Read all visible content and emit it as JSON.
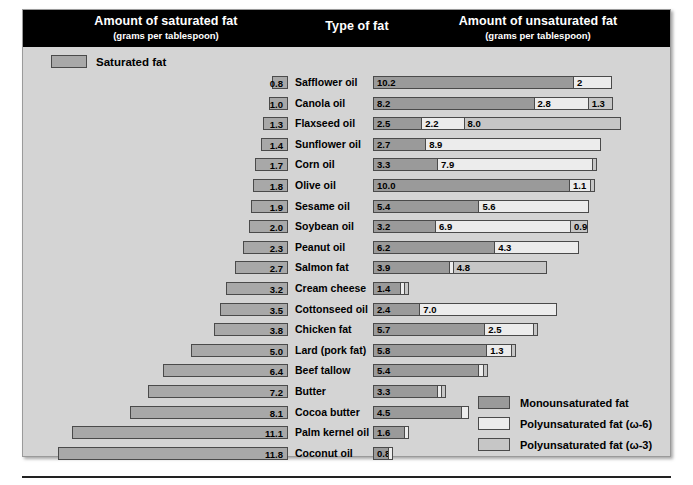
{
  "header": {
    "left_title": "Amount of saturated fat",
    "left_subtitle": "(grams per tablespoon)",
    "middle_title": "Type of fat",
    "right_title": "Amount of unsaturated fat",
    "right_subtitle": "(grams per tablespoon)"
  },
  "saturated_key": {
    "label": "Saturated fat",
    "swatch": "saturated-swatch"
  },
  "legend": {
    "items": [
      {
        "label": "Monounsaturated fat",
        "key": "mono",
        "color": "#9a9a9a"
      },
      {
        "label": "Polyunsaturated fat (ω-6)",
        "key": "o6",
        "color": "#ececec"
      },
      {
        "label": "Polyunsaturated fat (ω-3)",
        "key": "o3",
        "color": "#c6c6c6"
      }
    ]
  },
  "colors": {
    "saturated": "#a8a8a8",
    "mono": "#9a9a9a",
    "omega6": "#ececec",
    "omega3": "#c6c6c6",
    "panel_bg": "#d4d4d4",
    "header_bg": "#000000",
    "outline": "#4a4a4a"
  },
  "chart_data": {
    "type": "bar",
    "subtitle": "grams per tablespoon",
    "xlabel": "grams per tablespoon",
    "ylabel": "Type of fat",
    "orientation": "horizontal",
    "layout": "diverging stacked bars; saturated fat extends left, unsaturated fat extends right",
    "grid": false,
    "legend_position": "bottom-right",
    "series": [
      {
        "name": "Saturated fat",
        "color": "#a8a8a8"
      },
      {
        "name": "Monounsaturated fat",
        "color": "#9a9a9a"
      },
      {
        "name": "Polyunsaturated fat (ω-6)",
        "color": "#ececec"
      },
      {
        "name": "Polyunsaturated fat (ω-3)",
        "color": "#c6c6c6"
      }
    ],
    "categories": [
      "Safflower oil",
      "Canola oil",
      "Flaxseed oil",
      "Sunflower oil",
      "Corn oil",
      "Olive oil",
      "Sesame oil",
      "Soybean oil",
      "Peanut oil",
      "Salmon fat",
      "Cream cheese",
      "Cottonseed oil",
      "Chicken fat",
      "Lard (pork fat)",
      "Beef tallow",
      "Butter",
      "Cocoa butter",
      "Palm kernel oil",
      "Coconut oil"
    ],
    "rows": [
      {
        "name": "Safflower oil",
        "saturated": 0.8,
        "saturated_label": "0.8",
        "mono": 10.2,
        "mono_label": "10.2",
        "omega6": 2.0,
        "omega6_label": "2",
        "omega3": 0.0,
        "omega3_label": ""
      },
      {
        "name": "Canola oil",
        "saturated": 1.0,
        "saturated_label": "1.0",
        "mono": 8.2,
        "mono_label": "8.2",
        "omega6": 2.8,
        "omega6_label": "2.8",
        "omega3": 1.3,
        "omega3_label": "1.3"
      },
      {
        "name": "Flaxseed oil",
        "saturated": 1.3,
        "saturated_label": "1.3",
        "mono": 2.5,
        "mono_label": "2.5",
        "omega6": 2.2,
        "omega6_label": "2.2",
        "omega3": 8.0,
        "omega3_label": "8.0"
      },
      {
        "name": "Sunflower oil",
        "saturated": 1.4,
        "saturated_label": "1.4",
        "mono": 2.7,
        "mono_label": "2.7",
        "omega6": 8.9,
        "omega6_label": "8.9",
        "omega3": 0.0,
        "omega3_label": ""
      },
      {
        "name": "Corn oil",
        "saturated": 1.7,
        "saturated_label": "1.7",
        "mono": 3.3,
        "mono_label": "3.3",
        "omega6": 7.9,
        "omega6_label": "7.9",
        "omega3": 0.15,
        "omega3_label": ""
      },
      {
        "name": "Olive oil",
        "saturated": 1.8,
        "saturated_label": "1.8",
        "mono": 10.0,
        "mono_label": "10.0",
        "omega6": 1.1,
        "omega6_label": "1.1",
        "omega3": 0.1,
        "omega3_label": ""
      },
      {
        "name": "Sesame oil",
        "saturated": 1.9,
        "saturated_label": "1.9",
        "mono": 5.4,
        "mono_label": "5.4",
        "omega6": 5.6,
        "omega6_label": "5.6",
        "omega3": 0.0,
        "omega3_label": ""
      },
      {
        "name": "Soybean oil",
        "saturated": 2.0,
        "saturated_label": "2.0",
        "mono": 3.2,
        "mono_label": "3.2",
        "omega6": 6.9,
        "omega6_label": "6.9",
        "omega3": 0.9,
        "omega3_label": "0.9"
      },
      {
        "name": "Peanut oil",
        "saturated": 2.3,
        "saturated_label": "2.3",
        "mono": 6.2,
        "mono_label": "6.2",
        "omega6": 4.3,
        "omega6_label": "4.3",
        "omega3": 0.0,
        "omega3_label": ""
      },
      {
        "name": "Salmon fat",
        "saturated": 2.7,
        "saturated_label": "2.7",
        "mono": 3.9,
        "mono_label": "3.9",
        "omega6": 0.2,
        "omega6_label": "",
        "omega3": 4.8,
        "omega3_label": "4.8"
      },
      {
        "name": "Cream cheese",
        "saturated": 3.2,
        "saturated_label": "3.2",
        "mono": 1.4,
        "mono_label": "1.4",
        "omega6": 0.15,
        "omega6_label": "",
        "omega3": 0.1,
        "omega3_label": ""
      },
      {
        "name": "Cottonseed oil",
        "saturated": 3.5,
        "saturated_label": "3.5",
        "mono": 2.4,
        "mono_label": "2.4",
        "omega6": 7.0,
        "omega6_label": "7.0",
        "omega3": 0.0,
        "omega3_label": ""
      },
      {
        "name": "Chicken fat",
        "saturated": 3.8,
        "saturated_label": "3.8",
        "mono": 5.7,
        "mono_label": "5.7",
        "omega6": 2.5,
        "omega6_label": "2.5",
        "omega3": 0.15,
        "omega3_label": ""
      },
      {
        "name": "Lard (pork fat)",
        "saturated": 5.0,
        "saturated_label": "5.0",
        "mono": 5.8,
        "mono_label": "5.8",
        "omega6": 1.3,
        "omega6_label": "1.3",
        "omega3": 0.1,
        "omega3_label": ""
      },
      {
        "name": "Beef tallow",
        "saturated": 6.4,
        "saturated_label": "6.4",
        "mono": 5.4,
        "mono_label": "5.4",
        "omega6": 0.3,
        "omega6_label": "",
        "omega3": 0.1,
        "omega3_label": ""
      },
      {
        "name": "Butter",
        "saturated": 7.2,
        "saturated_label": "7.2",
        "mono": 3.3,
        "mono_label": "3.3",
        "omega6": 0.2,
        "omega6_label": "",
        "omega3": 0.1,
        "omega3_label": ""
      },
      {
        "name": "Cocoa butter",
        "saturated": 8.1,
        "saturated_label": "8.1",
        "mono": 4.5,
        "mono_label": "4.5",
        "omega6": 0.4,
        "omega6_label": "",
        "omega3": 0.0,
        "omega3_label": ""
      },
      {
        "name": "Palm kernel oil",
        "saturated": 11.1,
        "saturated_label": "11.1",
        "mono": 1.6,
        "mono_label": "1.6",
        "omega6": 0.2,
        "omega6_label": "",
        "omega3": 0.0,
        "omega3_label": ""
      },
      {
        "name": "Coconut oil",
        "saturated": 11.8,
        "saturated_label": "11.8",
        "mono": 0.8,
        "mono_label": "0.8",
        "omega6": 0.2,
        "omega6_label": "",
        "omega3": 0.0,
        "omega3_label": ""
      }
    ]
  }
}
